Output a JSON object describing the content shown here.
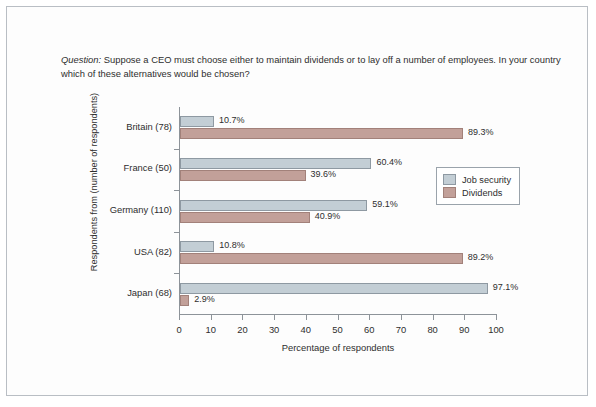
{
  "caption": {
    "lead": "Question:",
    "text": " Suppose a CEO must choose either to maintain dividends or to lay off a number of employees. In your country which of these alternatives would be chosen?"
  },
  "legend": {
    "items": [
      {
        "label": "Job security",
        "color": "#c3ced5"
      },
      {
        "label": "Dividends",
        "color": "#c2a099"
      }
    ]
  },
  "chart_data": {
    "type": "bar",
    "orientation": "horizontal",
    "title": "",
    "xlabel": "Percentage of respondents",
    "ylabel": "Respondents from (number of respondents)",
    "xlim": [
      0,
      100
    ],
    "xticks": [
      0,
      10,
      20,
      30,
      40,
      50,
      60,
      70,
      80,
      90,
      100
    ],
    "grid": false,
    "legend_position": "right",
    "categories": [
      "Britain (78)",
      "France (50)",
      "Germany (110)",
      "USA (82)",
      "Japan (68)"
    ],
    "series": [
      {
        "name": "Job security",
        "color": "#c3ced5",
        "values": [
          10.7,
          60.4,
          59.1,
          10.8,
          97.1
        ],
        "labels": [
          "10.7%",
          "60.4%",
          "59.1%",
          "10.8%",
          "97.1%"
        ]
      },
      {
        "name": "Dividends",
        "color": "#c2a099",
        "values": [
          89.3,
          39.6,
          40.9,
          89.2,
          2.9
        ],
        "labels": [
          "89.3%",
          "39.6%",
          "40.9%",
          "89.2%",
          "2.9%"
        ]
      }
    ]
  }
}
